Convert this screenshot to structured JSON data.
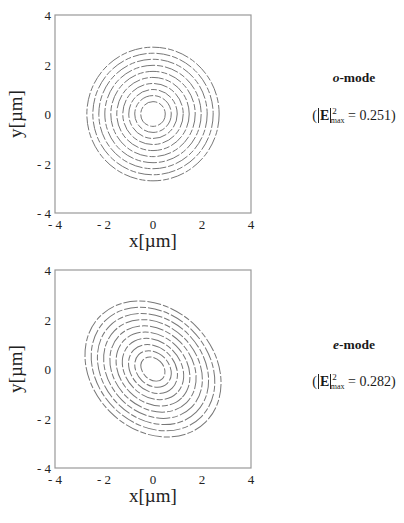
{
  "chart_data": [
    {
      "type": "contour",
      "title": "o-mode",
      "annotation": "(|E|²max = 0.251)",
      "max_intensity": 0.251,
      "xlabel": "x[µm]",
      "ylabel": "y[µm]",
      "xlim": [
        -4,
        4
      ],
      "ylim": [
        -4,
        4
      ],
      "xticks": [
        "- 4",
        "- 2",
        "0",
        "2",
        "4"
      ],
      "yticks": [
        "4",
        "2",
        "0",
        "- 2",
        "- 4"
      ],
      "grid": false,
      "contour_shape": "circular",
      "center": [
        0,
        0
      ],
      "num_contours": 10,
      "outer_radius_um": 2.7,
      "inner_radius_um": 0.5,
      "tilt_deg": 0
    },
    {
      "type": "contour",
      "title": "e-mode",
      "annotation": "(|E|²max = 0.282)",
      "max_intensity": 0.282,
      "xlabel": "x[µm]",
      "ylabel": "y[µm]",
      "xlim": [
        -4,
        4
      ],
      "ylim": [
        -4,
        4
      ],
      "xticks": [
        "- 4",
        "- 2",
        "0",
        "2",
        "4"
      ],
      "yticks": [
        "4",
        "2",
        "0",
        "- 2",
        "- 4"
      ],
      "grid": false,
      "contour_shape": "elliptical, tilted (major axis upper-left to lower-right)",
      "center": [
        0,
        0
      ],
      "num_contours": 10,
      "outer_semi_major_um": 3.05,
      "outer_semi_minor_um": 2.45,
      "inner_semi_major_um": 0.55,
      "inner_semi_minor_um": 0.42,
      "tilt_deg": 45
    }
  ],
  "panels": {
    "o": {
      "mode_letter": "o",
      "mode_suffix": "-mode",
      "value_prefix": "(",
      "value_E": "E",
      "value_sup": "2",
      "value_sub": "max",
      "value_rest": " = 0.251)"
    },
    "e": {
      "mode_letter": "e",
      "mode_suffix": "-mode",
      "value_prefix": "(",
      "value_E": "E",
      "value_sup": "2",
      "value_sub": "max",
      "value_rest": " = 0.282)"
    }
  }
}
